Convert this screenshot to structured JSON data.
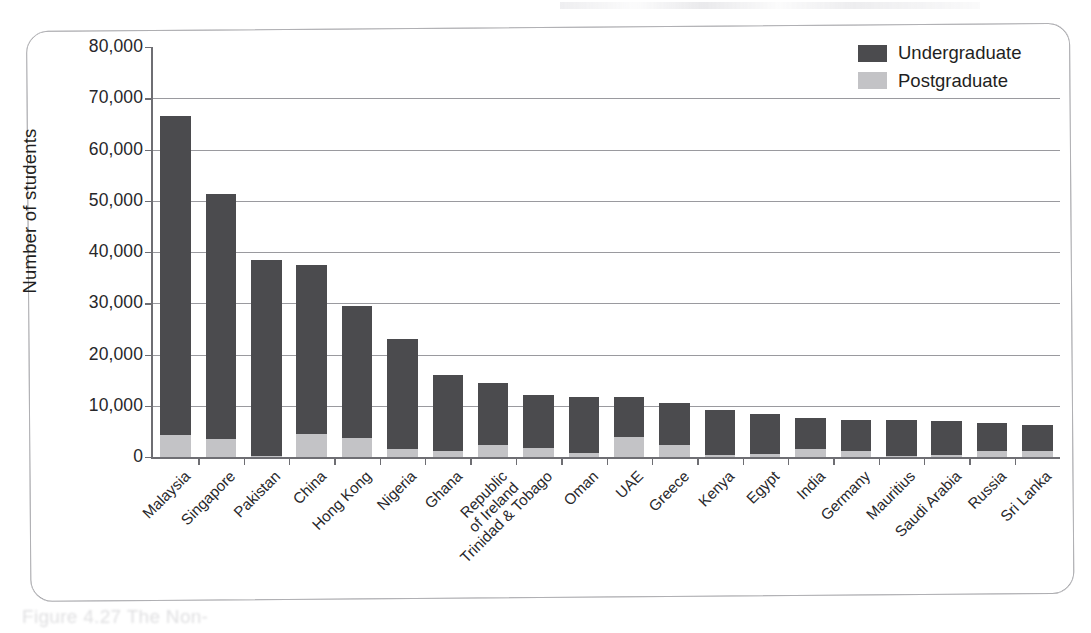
{
  "figure": {
    "caption_partial": "Figure 4.27  The Non-",
    "frame_style": "rounded-rectangle"
  },
  "legend": {
    "position": "top-right",
    "items": [
      {
        "label": "Undergraduate",
        "color": "#4b4b4e",
        "swatch_name": "legend-swatch-undergraduate"
      },
      {
        "label": "Postgraduate",
        "color": "#c3c3c6",
        "swatch_name": "legend-swatch-postgraduate"
      }
    ]
  },
  "axes": {
    "ylabel": "Number of students",
    "yticks": [
      "80,000",
      "70,000",
      "60,000",
      "50,000",
      "40,000",
      "30,000",
      "20,000",
      "10,000",
      "0"
    ],
    "ylim": [
      0,
      80000
    ],
    "ystep": 10000,
    "xlabel": ""
  },
  "chart_data": {
    "type": "bar",
    "subtype": "stacked-vertical",
    "title": "",
    "xlabel": "",
    "ylabel": "Number of students",
    "ylim": [
      0,
      80000
    ],
    "ystep": 10000,
    "grid": "horizontal",
    "legend_position": "top-right",
    "categories": [
      "Malaysia",
      "Singapore",
      "Pakistan",
      "China",
      "Hong Kong",
      "Nigeria",
      "Ghana",
      "Republic\nof Ireland",
      "Trinidad & Tobago",
      "Oman",
      "UAE",
      "Greece",
      "Kenya",
      "Egypt",
      "India",
      "Germany",
      "Mauritius",
      "Saudi Arabia",
      "Russia",
      "Sri Lanka"
    ],
    "series": [
      {
        "name": "Postgraduate",
        "color": "#c3c3c6",
        "values": [
          4200,
          3600,
          200,
          4400,
          3800,
          1600,
          1200,
          2400,
          1800,
          700,
          4000,
          2300,
          300,
          500,
          1500,
          1200,
          200,
          300,
          1100,
          1100
        ]
      },
      {
        "name": "Undergraduate",
        "color": "#4b4b4e",
        "values": [
          62300,
          47700,
          38300,
          33000,
          25700,
          21400,
          14900,
          12000,
          10300,
          11100,
          7700,
          8300,
          8900,
          7900,
          6200,
          6100,
          7100,
          6700,
          5500,
          5100
        ]
      }
    ],
    "totals": [
      66500,
      51300,
      38500,
      37400,
      29500,
      23000,
      16100,
      14400,
      12100,
      11800,
      11700,
      10600,
      9200,
      8400,
      7700,
      7300,
      7300,
      7000,
      6600,
      6200
    ]
  }
}
